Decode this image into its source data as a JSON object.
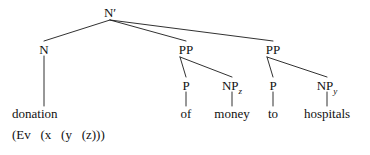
{
  "figure": {
    "kind": "syntax-tree",
    "ink_color": "#1a1a1a",
    "background_color": "#ffffff"
  },
  "nodes": {
    "root": {
      "label": "N",
      "prime": "′",
      "x": 110,
      "y": 13
    },
    "n_head": {
      "label": "N",
      "x": 44,
      "y": 50
    },
    "pp1": {
      "label": "PP",
      "x": 186,
      "y": 50
    },
    "pp2": {
      "label": "PP",
      "x": 273,
      "y": 50
    },
    "p1": {
      "label": "P",
      "x": 186,
      "y": 86
    },
    "np_z": {
      "label": "NP",
      "subscript": "z",
      "x": 232,
      "y": 86
    },
    "p2": {
      "label": "P",
      "x": 273,
      "y": 86
    },
    "np_y": {
      "label": "NP",
      "subscript": "y",
      "x": 327,
      "y": 86
    }
  },
  "leaves": {
    "donation": {
      "text": "donation",
      "x": 12,
      "y": 113
    },
    "semantics": {
      "text": "(Ev   (x   (y   (z)))",
      "x": 12,
      "y": 134
    },
    "of": {
      "text": "of",
      "x": 186,
      "y": 113
    },
    "money": {
      "text": "money",
      "x": 232,
      "y": 113
    },
    "to": {
      "text": "to",
      "x": 273,
      "y": 113
    },
    "hospitals": {
      "text": "hospitals",
      "x": 327,
      "y": 113
    }
  },
  "edges": [
    {
      "name": "root-to-n",
      "x1": 110,
      "y1": 20,
      "x2": 44,
      "y2": 41
    },
    {
      "name": "root-to-pp1",
      "x1": 110,
      "y1": 20,
      "x2": 186,
      "y2": 41
    },
    {
      "name": "root-to-pp2",
      "x1": 110,
      "y1": 20,
      "x2": 273,
      "y2": 41
    },
    {
      "name": "n-to-donation",
      "x1": 44,
      "y1": 56,
      "x2": 44,
      "y2": 106
    },
    {
      "name": "pp1-to-p1",
      "x1": 180,
      "y1": 57,
      "x2": 186,
      "y2": 77
    },
    {
      "name": "pp1-to-npz",
      "x1": 180,
      "y1": 57,
      "x2": 232,
      "y2": 77
    },
    {
      "name": "pp2-to-p2",
      "x1": 267,
      "y1": 57,
      "x2": 273,
      "y2": 77
    },
    {
      "name": "pp2-to-npy",
      "x1": 267,
      "y1": 57,
      "x2": 327,
      "y2": 77
    },
    {
      "name": "p1-to-of",
      "x1": 186,
      "y1": 92,
      "x2": 186,
      "y2": 106
    },
    {
      "name": "npz-to-money",
      "x1": 232,
      "y1": 92,
      "x2": 232,
      "y2": 106
    },
    {
      "name": "p2-to-to",
      "x1": 273,
      "y1": 92,
      "x2": 273,
      "y2": 106
    },
    {
      "name": "npy-to-hospitals",
      "x1": 327,
      "y1": 92,
      "x2": 327,
      "y2": 106
    }
  ]
}
